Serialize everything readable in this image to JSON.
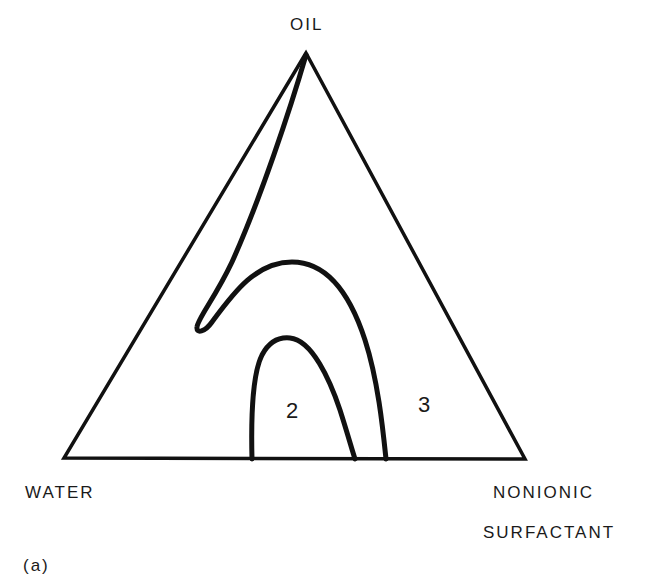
{
  "diagram": {
    "type": "ternary-phase-diagram",
    "vertices": {
      "top": "OIL",
      "bottom_left": "WATER",
      "bottom_right_line1": "NONIONIC",
      "bottom_right_line2": "SURFACTANT"
    },
    "regions": {
      "inner": "2",
      "outer": "3"
    },
    "panel_label": "(a)",
    "colors": {
      "ink": "#111111",
      "background": "#ffffff"
    }
  }
}
